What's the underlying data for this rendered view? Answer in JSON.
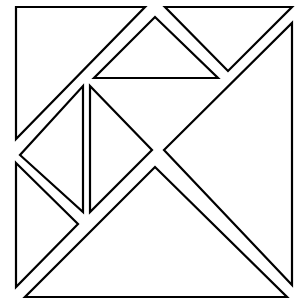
{
  "diagram": {
    "title": "",
    "stroke_color": "#000000",
    "fill_color": "#ffffff",
    "pieces": [
      {
        "name": "large-triangle-top-left",
        "points": "16,7 145,7 16,139"
      },
      {
        "name": "small-triangle-top-right",
        "points": "165,7 292,7 228,71"
      },
      {
        "name": "large-triangle-right",
        "points": "292,23 292,285 164,150"
      },
      {
        "name": "medium-triangle-top-center",
        "points": "94,78 218,78 155,17"
      },
      {
        "name": "small-triangle-middle-left",
        "points": "83,86 83,212 20,155"
      },
      {
        "name": "small-triangle-middle-right",
        "points": "90,86 90,212 152,150"
      },
      {
        "name": "small-triangle-bottom-left",
        "points": "16,163 78,224 16,287"
      },
      {
        "name": "large-triangle-bottom",
        "points": "25,297 287,297 155,167"
      }
    ]
  }
}
